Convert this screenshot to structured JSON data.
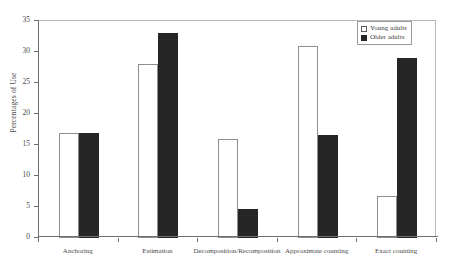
{
  "chart_data": {
    "type": "bar",
    "title": "",
    "subtitle": "",
    "xlabel": "",
    "ylabel": "Percentages of Use",
    "ylim": [
      0,
      35
    ],
    "ytick_step": 5,
    "ytick_labels": [
      "0",
      "5",
      "10",
      "15",
      "20",
      "25",
      "30",
      "35"
    ],
    "grid": false,
    "legend_position": "top-right",
    "categories": [
      "Anchoring",
      "Estimation",
      "Decomposition/Recomposition",
      "Approximate counting",
      "Exact counting"
    ],
    "series": [
      {
        "name": "Young adults",
        "color": "#ffffff",
        "edge_color": "#8d8d8d",
        "values": [
          17,
          28,
          16,
          31,
          6.7
        ]
      },
      {
        "name": "Older adults",
        "color": "#262626",
        "edge_color": "#262626",
        "values": [
          17,
          33,
          4.7,
          16.6,
          29
        ]
      }
    ]
  },
  "legend": {
    "items": [
      {
        "label": "Young adults",
        "swatch": "open-square-icon"
      },
      {
        "label": "Older adults",
        "swatch": "filled-square-icon"
      }
    ]
  },
  "axes": {
    "y_title": "Percentages of Use"
  }
}
